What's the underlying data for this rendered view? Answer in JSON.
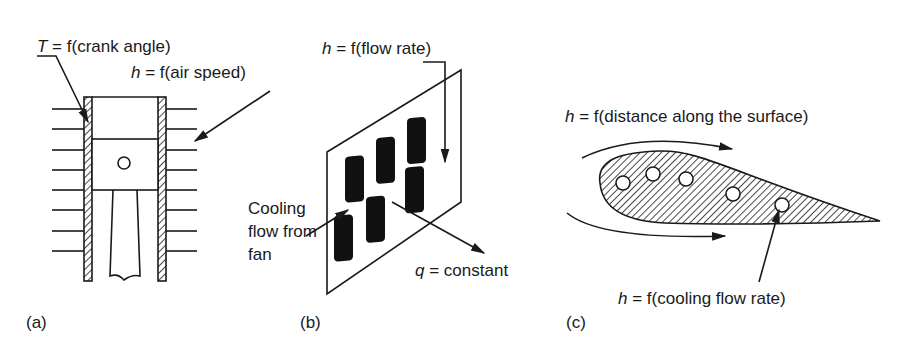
{
  "figure": {
    "panels": [
      {
        "id": "a",
        "tag": "(a)",
        "subject": "air-cooled engine cylinder with piston",
        "labels": {
          "temperature": {
            "var": "T",
            "eq": " = f(crank angle)"
          },
          "convection": {
            "var": "h",
            "eq": " = f(air speed)"
          }
        }
      },
      {
        "id": "b",
        "tag": "(b)",
        "subject": "circuit board with heat-generating chips",
        "labels": {
          "convection": {
            "var": "h",
            "eq": " = f(flow rate)"
          },
          "flow": "Cooling flow from fan",
          "heat_flux": {
            "var": "q",
            "eq": " = constant"
          }
        }
      },
      {
        "id": "c",
        "tag": "(c)",
        "subject": "cooled turbine blade airfoil with internal cooling passages",
        "labels": {
          "surface": {
            "var": "h",
            "eq": " = f(distance along the surface)"
          },
          "cooling": {
            "var": "h",
            "eq": " = f(cooling flow rate)"
          }
        }
      }
    ]
  },
  "colors": {
    "ink": "#1a1a1a",
    "background": "#ffffff"
  }
}
